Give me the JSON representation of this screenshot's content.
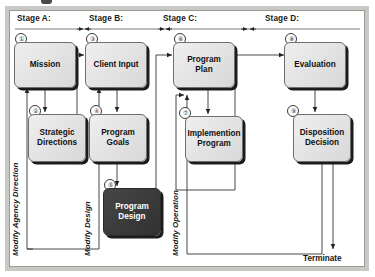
{
  "figure": {
    "frame_color": "#c8c8c4",
    "accent_dark": "#3a3a3a"
  },
  "stages": [
    {
      "label": "Stage A:"
    },
    {
      "label": "Stage B:"
    },
    {
      "label": "Stage C:"
    },
    {
      "label": "Stage D:"
    }
  ],
  "nodes": [
    {
      "num": "①",
      "label": "Mission"
    },
    {
      "num": "②",
      "label": "Strategic\nDirections"
    },
    {
      "num": "③",
      "label": "Client Input"
    },
    {
      "num": "④",
      "label": "Program\nGoals"
    },
    {
      "num": "⑤",
      "label": "Program\nDesign"
    },
    {
      "num": "⑥",
      "label": "Program\nPlan"
    },
    {
      "num": "⑦",
      "label": "Implemention\nProgram"
    },
    {
      "num": "⑧",
      "label": "Evaluation"
    },
    {
      "num": "⑨",
      "label": "Disposition\nDecision"
    }
  ],
  "feedback_labels": [
    {
      "label": "Modify Agency Direction"
    },
    {
      "label": "Modify Design"
    },
    {
      "label": "Modify Operation"
    }
  ],
  "terminate": {
    "label": "Terminate"
  }
}
